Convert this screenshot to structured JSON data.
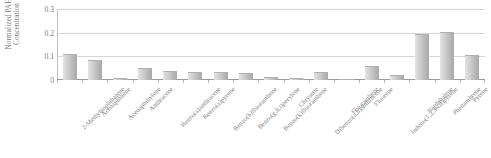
{
  "chart_data": {
    "type": "bar",
    "title": "",
    "xlabel": "",
    "ylabel": "Normalized PAH Concentration",
    "ylabel_line1": "Normalized PAH",
    "ylabel_line2": "Concentration",
    "ylim": [
      0,
      0.3
    ],
    "ytick_labels": [
      "0",
      "0.1",
      "0.2",
      "0.3"
    ],
    "ytick_values": [
      0,
      0.1,
      0.2,
      0.3
    ],
    "grid": true,
    "legend": "none",
    "bar_color": "#c4c4c4",
    "categories": [
      "2-Methylnaphthalene",
      "Acenaphthene",
      "Acenaphthylene",
      "Anthracene",
      "Benzo(a)anthracene",
      "Benzo(a)pyrene",
      "Benzo(b)fluoranthene",
      "Benzo(g,h,i)perylene",
      "Benzo(k)fluoranthene",
      "Chrysene",
      "Dibenzo(a,h)anthracene",
      "Fluoranthene",
      "Fluorene",
      "Indeno(1,2,3-cd)pyrene",
      "Naphthalene",
      "Phenanthrene",
      "Pyrene"
    ],
    "values": [
      0.105,
      0.082,
      0.003,
      0.045,
      0.032,
      0.03,
      0.028,
      0.024,
      0.01,
      0.004,
      0.03,
      0.002,
      0.055,
      0.018,
      0.19,
      0.2,
      0.1
    ]
  }
}
